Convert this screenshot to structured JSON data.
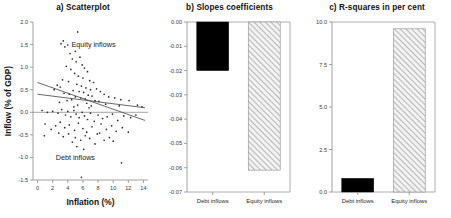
{
  "figure": {
    "panels": [
      "a",
      "b",
      "c"
    ]
  },
  "panel_a": {
    "title": "a) Scatterplot",
    "xlabel": "Inflation (%)",
    "ylabel": "Inflow (% of GDP)",
    "xticks": [
      "0",
      "2",
      "4",
      "6",
      "8",
      "10",
      "12",
      "14"
    ],
    "yticks": [
      "-1.5",
      "-1.0",
      "-0.5",
      "0.0",
      "0.5",
      "1.0",
      "1.5",
      "2.0"
    ],
    "annotation_equity": "Equity inflows",
    "annotation_debt": "Debt inflows"
  },
  "panel_b": {
    "title": "b) Slopes coefficients",
    "yticks": [
      "0.00",
      "-0.01",
      "-0.02",
      "-0.03",
      "-0.04",
      "-0.05",
      "-0.06",
      "-0.07"
    ],
    "categories": [
      "Debt inflows",
      "Equity inflows"
    ]
  },
  "panel_c": {
    "title": "c) R-squares in per cent",
    "yticks": [
      "0.0",
      "2.5",
      "5.0",
      "7.5",
      "10.0"
    ],
    "categories": [
      "Debt inflows",
      "Equity inflows"
    ]
  },
  "chart_data": [
    {
      "type": "scatter",
      "panel": "a",
      "title": "a) Scatterplot",
      "xlabel": "Inflation (%)",
      "ylabel": "Inflow (% of GDP)",
      "xlim": [
        -0.6,
        14.6
      ],
      "ylim": [
        -1.5,
        2.0
      ],
      "xticks": [
        0,
        2,
        4,
        6,
        8,
        10,
        12,
        14
      ],
      "yticks": [
        -1.5,
        -1.0,
        -0.5,
        0.0,
        0.5,
        1.0,
        1.5,
        2.0
      ],
      "grid": false,
      "legend": "in-plot annotations",
      "annotations": [
        {
          "text": "Equity inflows",
          "x": 7.4,
          "y": 1.45
        },
        {
          "text": "Debt inflows",
          "x": 5.0,
          "y": -1.05
        }
      ],
      "reference_lines": [
        {
          "type": "horizontal",
          "y": 0.0
        }
      ],
      "series": [
        {
          "name": "Equity inflows",
          "marker": "dot",
          "points": [
            [
              3.1,
              1.52
            ],
            [
              3.4,
              1.58
            ],
            [
              3.6,
              1.45
            ],
            [
              4.0,
              1.49
            ],
            [
              4.3,
              1.3
            ],
            [
              5.3,
              1.78
            ],
            [
              5.0,
              1.35
            ],
            [
              4.6,
              1.18
            ],
            [
              5.6,
              1.22
            ],
            [
              5.1,
              1.12
            ],
            [
              3.8,
              1.02
            ],
            [
              4.4,
              0.95
            ],
            [
              5.9,
              1.05
            ],
            [
              6.2,
              0.98
            ],
            [
              6.6,
              0.9
            ],
            [
              4.9,
              0.86
            ],
            [
              5.4,
              0.8
            ],
            [
              6.0,
              0.76
            ],
            [
              3.3,
              0.72
            ],
            [
              4.1,
              0.68
            ],
            [
              6.9,
              0.7
            ],
            [
              7.4,
              0.66
            ],
            [
              5.2,
              0.62
            ],
            [
              5.8,
              0.58
            ],
            [
              2.6,
              0.6
            ],
            [
              3.0,
              0.56
            ],
            [
              6.4,
              0.54
            ],
            [
              7.0,
              0.5
            ],
            [
              7.8,
              0.52
            ],
            [
              4.7,
              0.48
            ],
            [
              5.5,
              0.46
            ],
            [
              6.1,
              0.44
            ],
            [
              8.3,
              0.46
            ],
            [
              2.2,
              0.5
            ],
            [
              3.5,
              0.42
            ],
            [
              4.2,
              0.4
            ],
            [
              6.7,
              0.38
            ],
            [
              7.2,
              0.36
            ],
            [
              8.8,
              0.4
            ],
            [
              9.4,
              0.34
            ],
            [
              5.0,
              0.34
            ],
            [
              5.7,
              0.32
            ],
            [
              6.3,
              0.3
            ],
            [
              10.2,
              0.32
            ],
            [
              11.0,
              0.28
            ],
            [
              4.5,
              0.28
            ],
            [
              3.9,
              0.26
            ],
            [
              7.6,
              0.26
            ],
            [
              8.1,
              0.24
            ],
            [
              12.1,
              0.26
            ],
            [
              13.2,
              0.16
            ],
            [
              13.8,
              0.12
            ],
            [
              2.9,
              0.22
            ],
            [
              6.5,
              0.2
            ],
            [
              9.0,
              0.18
            ],
            [
              5.3,
              0.16
            ],
            [
              7.1,
              0.14
            ],
            [
              4.8,
              0.12
            ],
            [
              6.8,
              0.1
            ],
            [
              10.8,
              0.14
            ]
          ]
        },
        {
          "name": "Debt inflows",
          "marker": "dot",
          "points": [
            [
              0.6,
              0.04
            ],
            [
              1.3,
              0.0
            ],
            [
              2.0,
              0.02
            ],
            [
              2.7,
              -0.02
            ],
            [
              3.2,
              0.06
            ],
            [
              3.7,
              -0.06
            ],
            [
              4.0,
              0.02
            ],
            [
              4.4,
              -0.1
            ],
            [
              4.8,
              0.04
            ],
            [
              5.1,
              -0.04
            ],
            [
              5.5,
              -0.12
            ],
            [
              5.9,
              0.0
            ],
            [
              6.2,
              -0.08
            ],
            [
              6.6,
              -0.16
            ],
            [
              7.0,
              -0.02
            ],
            [
              7.5,
              -0.2
            ],
            [
              8.0,
              -0.06
            ],
            [
              8.6,
              -0.14
            ],
            [
              9.2,
              -0.1
            ],
            [
              9.9,
              -0.04
            ],
            [
              10.6,
              -0.18
            ],
            [
              11.4,
              -0.08
            ],
            [
              12.3,
              -0.12
            ],
            [
              13.0,
              -0.06
            ],
            [
              1.0,
              -0.26
            ],
            [
              2.4,
              -0.3
            ],
            [
              3.0,
              -0.22
            ],
            [
              3.6,
              -0.34
            ],
            [
              4.2,
              -0.28
            ],
            [
              4.9,
              -0.4
            ],
            [
              5.4,
              -0.24
            ],
            [
              6.0,
              -0.36
            ],
            [
              6.5,
              -0.44
            ],
            [
              7.2,
              -0.32
            ],
            [
              7.9,
              -0.48
            ],
            [
              8.4,
              -0.26
            ],
            [
              9.1,
              -0.38
            ],
            [
              9.8,
              -0.3
            ],
            [
              10.4,
              -0.42
            ],
            [
              11.2,
              -0.34
            ],
            [
              12.0,
              -0.44
            ],
            [
              5.0,
              -0.56
            ],
            [
              5.7,
              -0.62
            ],
            [
              6.3,
              -0.52
            ],
            [
              4.6,
              -0.66
            ],
            [
              6.9,
              -0.58
            ],
            [
              7.6,
              -0.7
            ],
            [
              3.4,
              -0.54
            ],
            [
              8.2,
              -0.46
            ],
            [
              5.2,
              -0.76
            ],
            [
              6.1,
              -0.82
            ],
            [
              11.1,
              -1.12
            ],
            [
              5.8,
              -1.44
            ],
            [
              2.8,
              -0.46
            ],
            [
              1.8,
              -0.38
            ],
            [
              0.9,
              -0.52
            ],
            [
              4.1,
              -0.48
            ],
            [
              9.5,
              -0.56
            ],
            [
              10.0,
              -0.64
            ],
            [
              8.8,
              -0.62
            ]
          ]
        }
      ],
      "trend_lines": [
        {
          "name": "Equity inflows trend",
          "x0": 0.0,
          "y0": 0.66,
          "x1": 14.2,
          "y1": -0.18
        },
        {
          "name": "Debt inflows trend",
          "x0": 0.0,
          "y0": 0.4,
          "x1": 14.2,
          "y1": 0.1
        }
      ]
    },
    {
      "type": "bar",
      "panel": "b",
      "title": "b) Slopes coefficients",
      "xlabel": "",
      "ylabel": "",
      "categories": [
        "Debt inflows",
        "Equity inflows"
      ],
      "values": [
        -0.02,
        -0.061
      ],
      "ylim": [
        -0.07,
        0.0
      ],
      "yticks": [
        0.0,
        -0.01,
        -0.02,
        -0.03,
        -0.04,
        -0.05,
        -0.06,
        -0.07
      ],
      "grid": false,
      "styles": [
        "solid-black",
        "hatched-gray"
      ]
    },
    {
      "type": "bar",
      "panel": "c",
      "title": "c) R-squares in per cent",
      "xlabel": "",
      "ylabel": "",
      "categories": [
        "Debt inflows",
        "Equity inflows"
      ],
      "values": [
        0.8,
        9.6
      ],
      "ylim": [
        0.0,
        10.0
      ],
      "yticks": [
        0.0,
        2.5,
        5.0,
        7.5,
        10.0
      ],
      "grid": false,
      "styles": [
        "solid-black",
        "hatched-gray"
      ]
    }
  ]
}
